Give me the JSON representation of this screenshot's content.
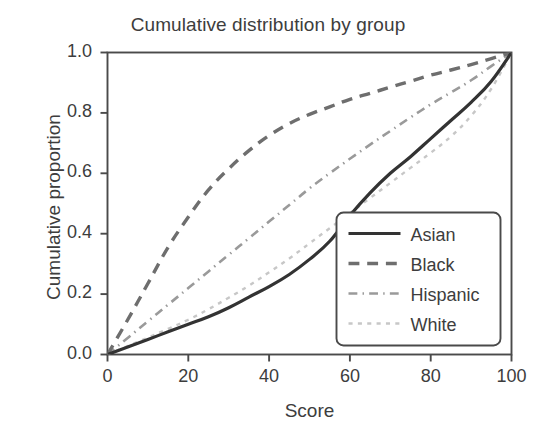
{
  "chart_data": {
    "type": "line",
    "title": "Cumulative distribution by group",
    "xlabel": "Score",
    "ylabel": "Cumulative proportion",
    "xlim": [
      0,
      100
    ],
    "ylim": [
      0,
      1.0
    ],
    "xticks": [
      0,
      20,
      40,
      60,
      80,
      100
    ],
    "xtick_labels": [
      "0",
      "20",
      "40",
      "60",
      "80",
      "100"
    ],
    "yticks": [
      0.0,
      0.2,
      0.4,
      0.6,
      0.8,
      1.0
    ],
    "ytick_labels": [
      "0.0",
      "0.2",
      "0.4",
      "0.6",
      "0.8",
      "1.0"
    ],
    "grid": false,
    "legend_position": "lower right",
    "x": [
      0,
      5,
      10,
      15,
      20,
      25,
      30,
      35,
      40,
      45,
      50,
      55,
      60,
      65,
      70,
      75,
      80,
      85,
      90,
      95,
      100
    ],
    "series": [
      {
        "name": "Asian",
        "linestyle": "solid",
        "color": "#333333",
        "width": 3.2,
        "values": [
          0.0,
          0.025,
          0.05,
          0.075,
          0.1,
          0.125,
          0.155,
          0.19,
          0.225,
          0.265,
          0.315,
          0.375,
          0.46,
          0.535,
          0.6,
          0.655,
          0.715,
          0.775,
          0.835,
          0.905,
          1.0
        ]
      },
      {
        "name": "Black",
        "linestyle": "dashed",
        "color": "#6e6e6e",
        "width": 3.4,
        "values": [
          0.0,
          0.115,
          0.235,
          0.355,
          0.455,
          0.545,
          0.615,
          0.675,
          0.725,
          0.765,
          0.795,
          0.82,
          0.845,
          0.865,
          0.885,
          0.905,
          0.925,
          0.942,
          0.96,
          0.98,
          1.0
        ]
      },
      {
        "name": "Hispanic",
        "linestyle": "dashdot",
        "color": "#9a9a9a",
        "width": 2.6,
        "values": [
          0.0,
          0.055,
          0.11,
          0.165,
          0.22,
          0.275,
          0.33,
          0.385,
          0.44,
          0.495,
          0.55,
          0.6,
          0.648,
          0.695,
          0.74,
          0.785,
          0.828,
          0.868,
          0.908,
          0.955,
          1.0
        ]
      },
      {
        "name": "White",
        "linestyle": "dotted",
        "color": "#c7c7c7",
        "width": 2.4,
        "values": [
          0.0,
          0.028,
          0.056,
          0.085,
          0.115,
          0.15,
          0.188,
          0.228,
          0.272,
          0.318,
          0.368,
          0.418,
          0.468,
          0.518,
          0.568,
          0.618,
          0.668,
          0.722,
          0.79,
          0.88,
          1.0
        ]
      }
    ]
  },
  "legend": {
    "items": [
      {
        "label": "Asian"
      },
      {
        "label": "Black"
      },
      {
        "label": "Hispanic"
      },
      {
        "label": "White"
      }
    ]
  }
}
